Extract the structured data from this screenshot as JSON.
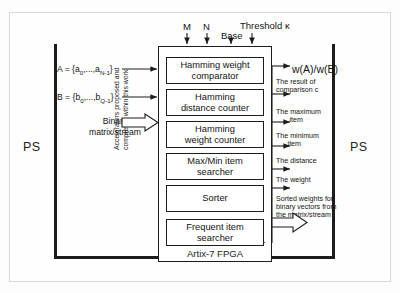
{
  "diagram": {
    "title_regions": {
      "ps_left": "PS",
      "ps_right": "PS",
      "pl": "PL",
      "fpga": "Artix-7 FPGA"
    },
    "top_inputs": [
      {
        "label": "M"
      },
      {
        "label": "N"
      },
      {
        "label": "Base"
      },
      {
        "label": "Threshold κ"
      }
    ],
    "left_inputs": {
      "vector_a": "A = {a",
      "vector_a_sub1": "0",
      "vector_a_mid": ",...,a",
      "vector_a_sub2": "N-1",
      "vector_a_end": "}",
      "vector_b": "B = {b",
      "vector_b_sub1": "0",
      "vector_b_mid": ",...,b",
      "vector_b_sub2": "Q-1",
      "vector_b_end": "}",
      "stream_line1": "Binary",
      "stream_line2": "matrix/stream"
    },
    "modules": [
      {
        "line1": "Hamming weight",
        "line2": "comparator"
      },
      {
        "line1": "Hamming",
        "line2": "distance counter"
      },
      {
        "line1": "Hamming",
        "line2": "weight counter"
      },
      {
        "line1": "Max/Min item",
        "line2": "searcher"
      },
      {
        "line1": "Sorter",
        "line2": ""
      },
      {
        "line1": "Frequent item",
        "line2": "searcher"
      }
    ],
    "right_outputs": [
      {
        "text": "w(A)/w(B)",
        "style": "large"
      },
      {
        "line1": "The result of",
        "line2": "comparison c"
      },
      {
        "line1": "The maximum",
        "line2": "item"
      },
      {
        "line1": "The minimum",
        "line2": "item"
      },
      {
        "line1": "The distance",
        "line2": ""
      },
      {
        "line1": "The weight",
        "line2": ""
      },
      {
        "line1": "Sorted weights for",
        "line2": "binary vectors from",
        "line3": "the matrix/stream"
      }
    ],
    "vertical_note": {
      "line1": "Accelerators proposed and",
      "line2": "completed within this work"
    },
    "colors": {
      "stroke": "#1c1c1c",
      "background": "#ffffff",
      "page": "#fdfdfd"
    }
  }
}
